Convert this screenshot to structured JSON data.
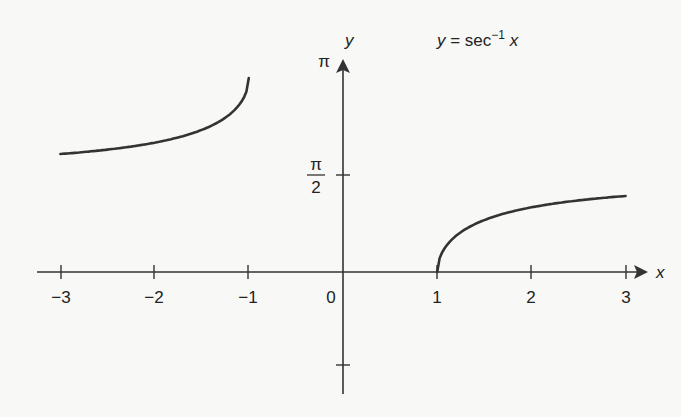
{
  "chart_data": {
    "type": "line",
    "title_parts": {
      "lhs": "y",
      "eq": " = sec",
      "sup": "−1",
      "rhs": " x"
    },
    "xlabel": "x",
    "ylabel": "y",
    "xlim": [
      -3,
      3
    ],
    "ylim": [
      -1.5708,
      3.1416
    ],
    "x_ticks": [
      -3,
      -2,
      -1,
      0,
      1,
      2,
      3
    ],
    "x_tick_labels": [
      "−3",
      "−2",
      "−1",
      "0",
      "1",
      "2",
      "3"
    ],
    "y_ticks": [
      1.5708,
      3.1416,
      -1.5708
    ],
    "y_tick_labels": {
      "pi": "π",
      "pi_half_num": "π",
      "pi_half_den": "2"
    },
    "grid": false,
    "legend": null,
    "series": [
      {
        "name": "sec⁻¹ x (x ≤ −1)",
        "x": [
          -3,
          -2.5,
          -2,
          -1.5,
          -1.2,
          -1.05,
          -1
        ],
        "values": [
          1.9106,
          1.9823,
          2.0944,
          2.3005,
          2.5559,
          2.8324,
          3.1416
        ]
      },
      {
        "name": "sec⁻¹ x (x ≥ 1)",
        "x": [
          1,
          1.05,
          1.2,
          1.5,
          2,
          2.5,
          3
        ],
        "values": [
          0,
          0.3092,
          0.5857,
          0.8411,
          1.0472,
          1.1593,
          1.231
        ]
      }
    ]
  }
}
